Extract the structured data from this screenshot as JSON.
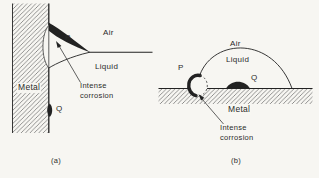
{
  "figure": {
    "background_color": "#f7f6f2",
    "ink_color": "#222222",
    "hatch_color": "#666666",
    "panels": {
      "a": {
        "caption": "(a)",
        "labels": {
          "p": "P",
          "q": "Q",
          "air": "Air",
          "liquid": "Liquid",
          "metal": "Metal",
          "annotation": "Intense\ncorrosion"
        }
      },
      "b": {
        "caption": "(b)",
        "labels": {
          "p": "P",
          "q": "Q",
          "air": "Air",
          "liquid": "Liquid",
          "metal": "Metal",
          "annotation": "Intense\ncorrosion"
        }
      }
    }
  }
}
